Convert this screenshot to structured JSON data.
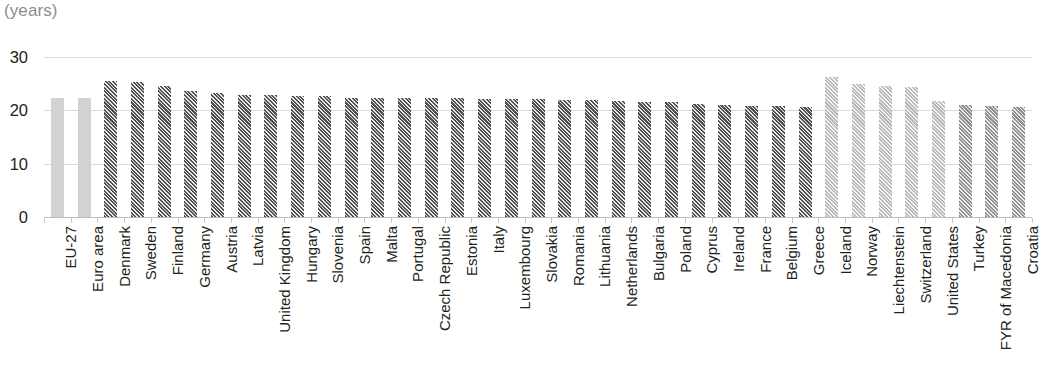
{
  "chart_data": {
    "type": "bar",
    "title": "",
    "subtitle": "",
    "unit_label": "(years)",
    "xlabel": "",
    "ylabel": "",
    "ylim": [
      0,
      30
    ],
    "yticks": [
      30,
      20,
      10,
      0
    ],
    "grid": true,
    "legend_position": "none",
    "categories": [
      "EU-27",
      "Euro area",
      "Denmark",
      "Sweden",
      "Finland",
      "Germany",
      "Austria",
      "Latvia",
      "United Kingdom",
      "Hungary",
      "Slovenia",
      "Spain",
      "Malta",
      "Portugal",
      "Czech Republic",
      "Estonia",
      "Italy",
      "Luxembourg",
      "Slovakia",
      "Romania",
      "Lithuania",
      "Netherlands",
      "Bulgaria",
      "Poland",
      "Cyprus",
      "Ireland",
      "France",
      "Belgium",
      "Greece",
      "Iceland",
      "Norway",
      "Liechtenstein",
      "Switzerland",
      "United States",
      "Turkey",
      "FYR of Macedonia",
      "Croatia"
    ],
    "values": [
      22.4,
      22.4,
      25.5,
      25.3,
      24.5,
      23.7,
      23.2,
      22.9,
      22.9,
      22.7,
      22.6,
      22.4,
      22.4,
      22.4,
      22.3,
      22.3,
      22.2,
      22.1,
      22.1,
      22.0,
      21.9,
      21.8,
      21.6,
      21.5,
      21.1,
      21.0,
      20.9,
      20.8,
      20.6,
      26.2,
      25.0,
      24.5,
      24.3,
      21.7,
      21.0,
      20.8,
      20.7
    ],
    "styles": [
      "solid-light",
      "solid-light",
      "hatch-dark",
      "hatch-dark",
      "hatch-dark",
      "hatch-dark",
      "hatch-dark",
      "hatch-dark",
      "hatch-dark",
      "hatch-dark",
      "hatch-dark",
      "hatch-dark",
      "hatch-dark",
      "hatch-dark",
      "hatch-dark",
      "hatch-dark",
      "hatch-dark",
      "hatch-dark",
      "hatch-dark",
      "hatch-dark",
      "hatch-dark",
      "hatch-dark",
      "hatch-dark",
      "hatch-dark",
      "hatch-dark",
      "hatch-dark",
      "hatch-dark",
      "hatch-dark",
      "hatch-dark",
      "hatch-light",
      "hatch-light",
      "hatch-light",
      "hatch-light",
      "hatch-light",
      "hatch-mid",
      "hatch-mid",
      "hatch-mid"
    ],
    "colors": {
      "aggregate_bar": "#d2d2d2",
      "member_bar_hatch": "#4f4f4f",
      "non_eu_bar_hatch": "#b9b9b9",
      "candidate_bar_hatch": "#8f8f8f",
      "gridline": "#d9d9d9",
      "axis": "#bdbdbd",
      "text": "#231f20",
      "unit_label": "#8d8d8d"
    }
  }
}
